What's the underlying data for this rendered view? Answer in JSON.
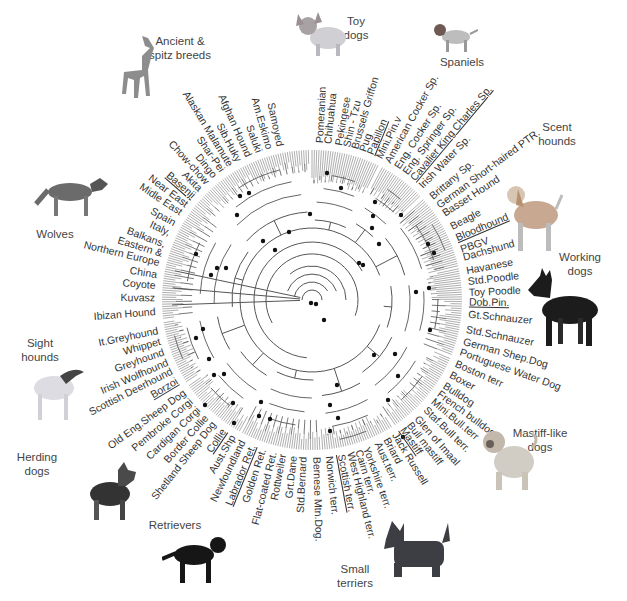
{
  "diagram": {
    "type": "circular-phylogenetic-tree",
    "center": [
      312,
      300
    ],
    "leaf_radius": 150,
    "label_radius": 157,
    "colors": {
      "branch": "#555555",
      "node_dot": "#111111",
      "text": "#333333",
      "group_text": "#444444"
    },
    "groups": [
      {
        "name": "Ancient & spitz breeds",
        "lines": [
          "Ancient &",
          "spitz breeds"
        ],
        "x": 180,
        "y": 34
      },
      {
        "name": "Toy dogs",
        "lines": [
          "Toy",
          "dogs"
        ],
        "x": 356,
        "y": 14
      },
      {
        "name": "Spaniels",
        "lines": [
          "Spaniels"
        ],
        "x": 462,
        "y": 55
      },
      {
        "name": "Scent hounds",
        "lines": [
          "Scent",
          "hounds"
        ],
        "x": 557,
        "y": 120
      },
      {
        "name": "Working dogs",
        "lines": [
          "Working",
          "dogs"
        ],
        "x": 580,
        "y": 250
      },
      {
        "name": "Mastiff-like dogs",
        "lines": [
          "Mastiff-like",
          "dogs"
        ],
        "x": 540,
        "y": 426
      },
      {
        "name": "Small terriers",
        "lines": [
          "Small",
          "terriers"
        ],
        "x": 355,
        "y": 562
      },
      {
        "name": "Retrievers",
        "lines": [
          "Retrievers"
        ],
        "x": 175,
        "y": 518
      },
      {
        "name": "Herding dogs",
        "lines": [
          "Herding",
          "dogs"
        ],
        "x": 37,
        "y": 450
      },
      {
        "name": "Sight hounds",
        "lines": [
          "Sight",
          "hounds"
        ],
        "x": 40,
        "y": 336
      },
      {
        "name": "Wolves",
        "lines": [
          "Wolves"
        ],
        "x": 55,
        "y": 227
      }
    ],
    "leaves": [
      {
        "label": "Pomeranian",
        "angle": -87,
        "underline": false
      },
      {
        "label": "Chihuahua",
        "angle": -84,
        "underline": false
      },
      {
        "label": "Pekingese",
        "angle": -80,
        "underline": false
      },
      {
        "label": "Shin - Tzu",
        "angle": -77,
        "underline": false
      },
      {
        "label": "Brussels Griffon",
        "angle": -74,
        "underline": false
      },
      {
        "label": "Pug",
        "angle": -71,
        "underline": false
      },
      {
        "label": "Papillon",
        "angle": -68,
        "underline": true
      },
      {
        "label": "Mini.Pin.v",
        "angle": -64.5,
        "underline": false
      },
      {
        "label": "American Cocker Sp.",
        "angle": -61,
        "underline": false
      },
      {
        "label": "Eng. Cocker Sp.",
        "angle": -57,
        "underline": false
      },
      {
        "label": "Eng. Springer Sp.",
        "angle": -53.5,
        "underline": false
      },
      {
        "label": "Cavalier King Charles Sp.",
        "angle": -50,
        "underline": true
      },
      {
        "label": "Irish Water Sp.",
        "angle": -46,
        "underline": false
      },
      {
        "label": "Brittany Sp.",
        "angle": -40.5,
        "underline": false
      },
      {
        "label": "German Short-haired PTR.",
        "angle": -36.5,
        "underline": false
      },
      {
        "label": "Basset Hound",
        "angle": -33,
        "underline": false
      },
      {
        "label": "Beagle",
        "angle": -27.5,
        "underline": false
      },
      {
        "label": "Bloodhound",
        "angle": -23,
        "underline": true
      },
      {
        "label": "PBGV",
        "angle": -18.5,
        "underline": false
      },
      {
        "label": "Dachshund",
        "angle": -15.5,
        "underline": false
      },
      {
        "label": "Havanese",
        "angle": -10.5,
        "underline": false
      },
      {
        "label": "Std.Poodle",
        "angle": -6.5,
        "underline": false
      },
      {
        "label": "Toy Poodle",
        "angle": -2.5,
        "underline": false
      },
      {
        "label": "Dob.Pin.",
        "angle": 1,
        "underline": true
      },
      {
        "label": "Gt.Schnauzer",
        "angle": 5.5,
        "underline": false
      },
      {
        "label": "Std.Schnauzer",
        "angle": 11,
        "underline": false
      },
      {
        "label": "German Shep.Dog",
        "angle": 15.5,
        "underline": false
      },
      {
        "label": "Portuguese Water Dog",
        "angle": 19.5,
        "underline": false
      },
      {
        "label": "Boston terr",
        "angle": 24,
        "underline": false
      },
      {
        "label": "Boxer",
        "angle": 28.5,
        "underline": false
      },
      {
        "label": "Bulldog",
        "angle": 33,
        "underline": false
      },
      {
        "label": "French bulldog",
        "angle": 36.5,
        "underline": false
      },
      {
        "label": "Mini.Bull.terr",
        "angle": 40,
        "underline": false
      },
      {
        "label": "Staf.Bull terr.",
        "angle": 44,
        "underline": false
      },
      {
        "label": "Glen of Imaal",
        "angle": 48.5,
        "underline": false
      },
      {
        "label": "Bull mastiff",
        "angle": 52,
        "underline": false
      },
      {
        "label": "Mastiff",
        "angle": 55,
        "underline": true
      },
      {
        "label": "Jack Russell",
        "angle": 58.5,
        "underline": false
      },
      {
        "label": "Briard",
        "angle": 62,
        "underline": false
      },
      {
        "label": "Aust.terr.",
        "angle": 65.5,
        "underline": false
      },
      {
        "label": "Yorkshire terr.",
        "angle": 70,
        "underline": false
      },
      {
        "label": "Cairn terr.",
        "angle": 73,
        "underline": false
      },
      {
        "label": "West Highland terr.",
        "angle": 76,
        "underline": false
      },
      {
        "label": "Scottish terr.",
        "angle": 79.5,
        "underline": true
      },
      {
        "label": "Norwich terr.",
        "angle": 84,
        "underline": false
      },
      {
        "label": "Bernese Mtn.Dog.",
        "angle": 88.5,
        "underline": false
      },
      {
        "label": "Std.Bernard",
        "angle": 93,
        "underline": false
      },
      {
        "label": "Grt.Dane",
        "angle": 96.5,
        "underline": false
      },
      {
        "label": "Rottweiler",
        "angle": 100.5,
        "underline": false
      },
      {
        "label": "Flat-coated Ret.",
        "angle": 104,
        "underline": false
      },
      {
        "label": "Golden Ret.",
        "angle": 108,
        "underline": false
      },
      {
        "label": "Labrador Ret.",
        "angle": 112,
        "underline": true
      },
      {
        "label": "Newfoundland",
        "angle": 116,
        "underline": false
      },
      {
        "label": "Aust.Shp",
        "angle": 120,
        "underline": false
      },
      {
        "label": "Collie",
        "angle": 124,
        "underline": true
      },
      {
        "label": "Shetland Sheep Dog",
        "angle": 128.5,
        "underline": false
      },
      {
        "label": "Border Collie",
        "angle": 132,
        "underline": false
      },
      {
        "label": "Cardigan Corgi",
        "angle": 136,
        "underline": false
      },
      {
        "label": "Pembroke Corgi",
        "angle": 140,
        "underline": false
      },
      {
        "label": "Old Eng.Sheep Dog",
        "angle": 144,
        "underline": false
      },
      {
        "label": "Borzoi",
        "angle": 149,
        "underline": true
      },
      {
        "label": "Scottish Deerhound",
        "angle": 153,
        "underline": false
      },
      {
        "label": "Irish Wolfhound",
        "angle": 156.5,
        "underline": false
      },
      {
        "label": "Greyhound",
        "angle": 160.5,
        "underline": false
      },
      {
        "label": "Whippet",
        "angle": 164.5,
        "underline": false
      },
      {
        "label": "It.Greyhound",
        "angle": 168.5,
        "underline": false
      },
      {
        "label": "Ibizan Hound",
        "angle": 175.5,
        "underline": false
      },
      {
        "label": "Kuvasz",
        "angle": 180.5,
        "underline": false
      },
      {
        "label": "Coyote",
        "angle": 185,
        "underline": false
      },
      {
        "label": "China",
        "angle": 189,
        "underline": false
      },
      {
        "label": "Northern Europe",
        "angle": 193.5,
        "underline": false
      },
      {
        "label": "Eastern &",
        "angle": 197,
        "underline": false
      },
      {
        "label": "Balkans,",
        "angle": 200.5,
        "underline": false
      },
      {
        "label": "Italy,",
        "angle": 205,
        "underline": false
      },
      {
        "label": "Spain",
        "angle": 209,
        "underline": false
      },
      {
        "label": "Midle East",
        "angle": 213.5,
        "underline": false
      },
      {
        "label": "Near East",
        "angle": 217,
        "underline": false
      },
      {
        "label": "Basenji",
        "angle": 221,
        "underline": true
      },
      {
        "label": "Akita",
        "angle": 224.5,
        "underline": false
      },
      {
        "label": "Chow-chow",
        "angle": 228,
        "underline": false
      },
      {
        "label": "Dingo",
        "angle": 231.5,
        "underline": false
      },
      {
        "label": "Shar-Pei",
        "angle": 235,
        "underline": false
      },
      {
        "label": "Alaskan Malamute",
        "angle": 238.5,
        "underline": false
      },
      {
        "label": "Sib.Huky",
        "angle": 242,
        "underline": false
      },
      {
        "label": "Afghan Hound",
        "angle": 246,
        "underline": false
      },
      {
        "label": "Saluki",
        "angle": 250,
        "underline": false
      },
      {
        "label": "Am.Eskimo",
        "angle": 254,
        "underline": false
      },
      {
        "label": "Samoyed",
        "angle": 258,
        "underline": false
      }
    ],
    "clade_arcs": [
      {
        "name": "toy-clade-arc",
        "r": 150,
        "start": -90,
        "end": -63
      },
      {
        "name": "spaniel-clade-arc",
        "r": 150,
        "start": -62,
        "end": -44
      },
      {
        "name": "scent-clade-arc",
        "r": 150,
        "start": -42,
        "end": -13
      },
      {
        "name": "working-clade-arc",
        "r": 150,
        "start": -12,
        "end": 22
      },
      {
        "name": "mastiff-clade-arc",
        "r": 150,
        "start": 23,
        "end": 57
      },
      {
        "name": "terrier-clade-arc",
        "r": 150,
        "start": 58,
        "end": 86
      },
      {
        "name": "retriever-clade-arc",
        "r": 150,
        "start": 87,
        "end": 118
      },
      {
        "name": "herding-clade-arc",
        "r": 150,
        "start": 119,
        "end": 146
      },
      {
        "name": "sight-clade-arc",
        "r": 150,
        "start": 147,
        "end": 172
      },
      {
        "name": "wolf-clade-arc",
        "r": 150,
        "start": 173,
        "end": 219
      },
      {
        "name": "ancient-clade-arc",
        "r": 150,
        "start": 220,
        "end": 269
      }
    ],
    "backbone": [
      {
        "r": 10,
        "start": 180,
        "end": 360
      },
      {
        "r": 18,
        "start": 190,
        "end": 330
      },
      {
        "r": 26,
        "start": 200,
        "end": 340
      },
      {
        "r": 34,
        "start": 230,
        "end": 360
      },
      {
        "r": 46,
        "start": 150,
        "end": 380
      },
      {
        "r": 58,
        "start": 95,
        "end": 330
      },
      {
        "r": 72,
        "start": 20,
        "end": 340
      }
    ],
    "node_dots": [
      [
        311,
        303
      ],
      [
        316,
        304
      ],
      [
        324,
        320
      ],
      [
        337,
        385
      ],
      [
        359,
        263
      ],
      [
        363,
        265
      ],
      [
        375,
        202
      ],
      [
        373,
        216
      ],
      [
        372,
        228
      ],
      [
        379,
        244
      ],
      [
        401,
        215
      ],
      [
        428,
        244
      ],
      [
        434,
        253
      ],
      [
        416,
        292
      ],
      [
        429,
        288
      ],
      [
        430,
        330
      ],
      [
        395,
        354
      ],
      [
        374,
        355
      ],
      [
        398,
        376
      ],
      [
        388,
        400
      ],
      [
        403,
        437
      ],
      [
        330,
        431
      ],
      [
        338,
        418
      ],
      [
        330,
        405
      ],
      [
        270,
        419
      ],
      [
        259,
        416
      ],
      [
        261,
        402
      ],
      [
        233,
        403
      ],
      [
        234,
        423
      ],
      [
        205,
        405
      ],
      [
        224,
        374
      ],
      [
        214,
        375
      ],
      [
        203,
        329
      ],
      [
        196,
        338
      ],
      [
        209,
        359
      ],
      [
        226,
        268
      ],
      [
        217,
        268
      ],
      [
        211,
        275
      ],
      [
        196,
        254
      ],
      [
        240,
        196
      ],
      [
        237,
        215
      ],
      [
        249,
        193
      ],
      [
        327,
        173
      ],
      [
        341,
        188
      ],
      [
        310,
        214
      ],
      [
        289,
        232
      ],
      [
        263,
        241
      ],
      [
        275,
        250
      ]
    ]
  }
}
